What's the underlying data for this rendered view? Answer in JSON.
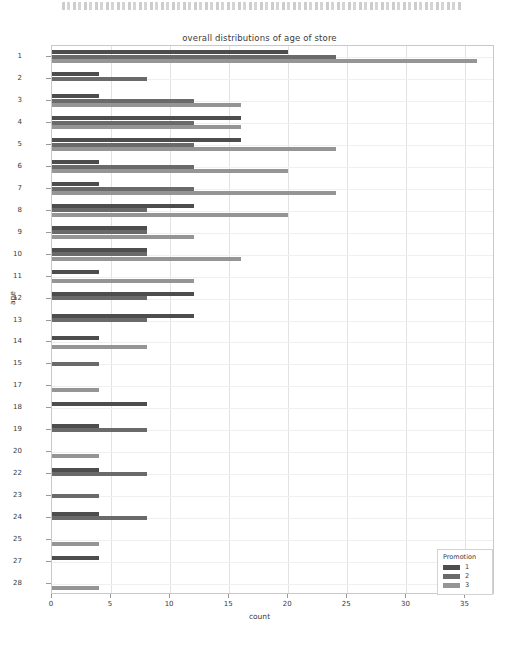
{
  "window": {
    "top_strip_text": ""
  },
  "chart_data": {
    "type": "bar",
    "orientation": "horizontal",
    "title": "overall distributions of age of store",
    "xlabel": "count",
    "ylabel": "age",
    "xlim": [
      0,
      37.5
    ],
    "ylim_categories_note": "age values, non-contiguous (16, 21, 26 absent)",
    "grid": true,
    "legend": {
      "title": "Promotion",
      "position": "lower right",
      "entries": [
        {
          "label": "1",
          "color": "#4d4d4d"
        },
        {
          "label": "2",
          "color": "#6a6a6a"
        },
        {
          "label": "3",
          "color": "#959595"
        }
      ]
    },
    "xticks": [
      0,
      5,
      10,
      15,
      20,
      25,
      30,
      35
    ],
    "categories": [
      "1",
      "2",
      "3",
      "4",
      "5",
      "6",
      "7",
      "8",
      "9",
      "10",
      "11",
      "12",
      "13",
      "14",
      "15",
      "17",
      "18",
      "19",
      "20",
      "22",
      "23",
      "24",
      "25",
      "27",
      "28"
    ],
    "series": [
      {
        "name": "1",
        "color": "#4d4d4d",
        "values": [
          20,
          4,
          4,
          16,
          16,
          4,
          4,
          12,
          8,
          8,
          4,
          12,
          12,
          4,
          0,
          0,
          8,
          4,
          0,
          4,
          0,
          4,
          0,
          4,
          0
        ]
      },
      {
        "name": "2",
        "color": "#6a6a6a",
        "values": [
          24,
          8,
          12,
          12,
          12,
          12,
          12,
          8,
          8,
          8,
          0,
          8,
          8,
          0,
          4,
          0,
          0,
          8,
          0,
          8,
          4,
          8,
          0,
          0,
          0
        ]
      },
      {
        "name": "3",
        "color": "#959595",
        "values": [
          36,
          0,
          16,
          16,
          24,
          20,
          24,
          20,
          12,
          16,
          12,
          0,
          0,
          8,
          0,
          4,
          0,
          0,
          4,
          0,
          0,
          0,
          4,
          0,
          4
        ]
      }
    ]
  }
}
